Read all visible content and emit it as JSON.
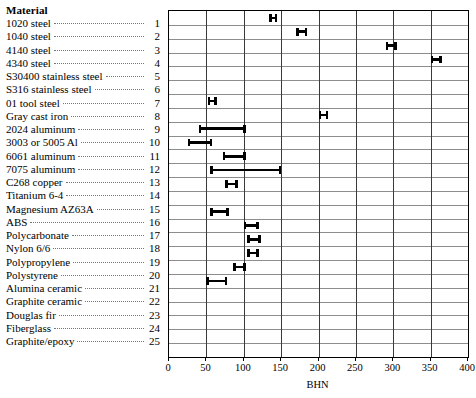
{
  "legend": {
    "heading": "Material",
    "items": [
      {
        "index": "1",
        "label": "1020 steel"
      },
      {
        "index": "2",
        "label": "1040 steel"
      },
      {
        "index": "3",
        "label": "4140 steel"
      },
      {
        "index": "4",
        "label": "4340 steel"
      },
      {
        "index": "5",
        "label": "S30400 stainless steel"
      },
      {
        "index": "6",
        "label": "S316 stainless steel"
      },
      {
        "index": "7",
        "label": "01 tool steel"
      },
      {
        "index": "8",
        "label": "Gray cast iron"
      },
      {
        "index": "9",
        "label": "2024 aluminum"
      },
      {
        "index": "10",
        "label": "3003 or 5005 Al"
      },
      {
        "index": "11",
        "label": "6061 aluminum"
      },
      {
        "index": "12",
        "label": "7075 aluminum"
      },
      {
        "index": "13",
        "label": "C268 copper"
      },
      {
        "index": "14",
        "label": "Titanium 6-4"
      },
      {
        "index": "15",
        "label": "Magnesium AZ63A"
      },
      {
        "index": "16",
        "label": "ABS"
      },
      {
        "index": "17",
        "label": "Polycarbonate"
      },
      {
        "index": "18",
        "label": "Nylon 6/6"
      },
      {
        "index": "19",
        "label": "Polypropylene"
      },
      {
        "index": "20",
        "label": "Polystyrene"
      },
      {
        "index": "21",
        "label": "Alumina ceramic"
      },
      {
        "index": "22",
        "label": "Graphite ceramic"
      },
      {
        "index": "23",
        "label": "Douglas fir"
      },
      {
        "index": "24",
        "label": "Fiberglass"
      },
      {
        "index": "25",
        "label": "Graphite/epoxy"
      }
    ]
  },
  "chart_data": {
    "type": "bar",
    "orientation": "horizontal",
    "subtype": "range-interval",
    "title": "",
    "xlabel": "BHN",
    "ylabel": "Material",
    "xlim": [
      0,
      400
    ],
    "xticks": [
      0,
      50,
      100,
      150,
      200,
      250,
      300,
      350,
      400
    ],
    "xtick_labels": [
      "0",
      "50",
      "100",
      "150",
      "200",
      "250",
      "300",
      "350",
      "400"
    ],
    "grid": {
      "horizontal": true,
      "vertical": true
    },
    "legend_position": "left-outside",
    "bar_color": "#000000",
    "grid_color_horizontal": "#8d8d8d",
    "grid_color_vertical": "#3a3a3a",
    "n_categories": 25,
    "categories": [
      "1020 steel",
      "1040 steel",
      "4140 steel",
      "4340 steel",
      "S30400 stainless steel",
      "S316 stainless steel",
      "01 tool steel",
      "Gray cast iron",
      "2024 aluminum",
      "3003 or 5005 Al",
      "6061 aluminum",
      "7075 aluminum",
      "C268 copper",
      "Titanium 6-4",
      "Magnesium AZ63A",
      "ABS",
      "Polycarbonate",
      "Nylon 6/6",
      "Polypropylene",
      "Polystyrene",
      "Alumina ceramic",
      "Graphite ceramic",
      "Douglas fir",
      "Fiberglass",
      "Graphite/epoxy"
    ],
    "ranges": [
      {
        "index": 1,
        "category": "1020 steel",
        "low": 134,
        "high": 145
      },
      {
        "index": 2,
        "category": "1040 steel",
        "low": 170,
        "high": 185
      },
      {
        "index": 3,
        "category": "4140 steel",
        "low": 290,
        "high": 305
      },
      {
        "index": 4,
        "category": "4340 steel",
        "low": 350,
        "high": 365
      },
      {
        "index": 5,
        "category": "S30400 stainless steel",
        "low": null,
        "high": null
      },
      {
        "index": 6,
        "category": "S316 stainless steel",
        "low": null,
        "high": null
      },
      {
        "index": 7,
        "category": "01 tool steel",
        "low": 52,
        "high": 64
      },
      {
        "index": 8,
        "category": "Gray cast iron",
        "low": 200,
        "high": 213
      },
      {
        "index": 9,
        "category": "2024 aluminum",
        "low": 40,
        "high": 103
      },
      {
        "index": 10,
        "category": "3003 or 5005 Al",
        "low": 25,
        "high": 58
      },
      {
        "index": 11,
        "category": "6061 aluminum",
        "low": 72,
        "high": 103
      },
      {
        "index": 12,
        "category": "7075 aluminum",
        "low": 55,
        "high": 150
      },
      {
        "index": 13,
        "category": "C268 copper",
        "low": 75,
        "high": 92
      },
      {
        "index": 14,
        "category": "Titanium 6-4",
        "low": null,
        "high": null
      },
      {
        "index": 15,
        "category": "Magnesium AZ63A",
        "low": 55,
        "high": 80
      },
      {
        "index": 16,
        "category": "ABS",
        "low": 100,
        "high": 120
      },
      {
        "index": 17,
        "category": "Polycarbonate",
        "low": 105,
        "high": 123
      },
      {
        "index": 18,
        "category": "Nylon 6/6",
        "low": 105,
        "high": 120
      },
      {
        "index": 19,
        "category": "Polypropylene",
        "low": 86,
        "high": 103
      },
      {
        "index": 20,
        "category": "Polystyrene",
        "low": 50,
        "high": 78
      },
      {
        "index": 21,
        "category": "Alumina ceramic",
        "low": null,
        "high": null
      },
      {
        "index": 22,
        "category": "Graphite ceramic",
        "low": null,
        "high": null
      },
      {
        "index": 23,
        "category": "Douglas fir",
        "low": null,
        "high": null
      },
      {
        "index": 24,
        "category": "Fiberglass",
        "low": null,
        "high": null
      },
      {
        "index": 25,
        "category": "Graphite/epoxy",
        "low": null,
        "high": null
      }
    ]
  }
}
